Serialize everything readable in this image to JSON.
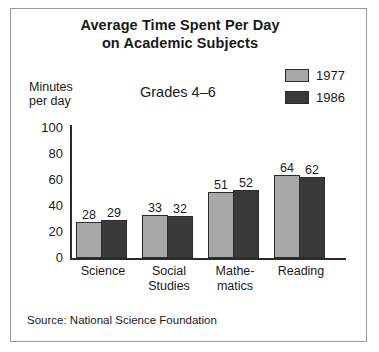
{
  "chart_data": {
    "type": "bar",
    "title": "Average Time Spent Per Day on Academic Subjects",
    "title_lines": [
      "Average Time Spent Per Day",
      "on Academic Subjects"
    ],
    "subtitle": "Grades 4–6",
    "ylabel": "Minutes per day",
    "ylabel_lines": [
      "Minutes",
      "per day"
    ],
    "xlabel": "",
    "categories": [
      "Science",
      "Social Studies",
      "Mathematics",
      "Reading"
    ],
    "category_lines": [
      [
        "Science"
      ],
      [
        "Social",
        "Studies"
      ],
      [
        "Mathe-",
        "matics"
      ],
      [
        "Reading"
      ]
    ],
    "series": [
      {
        "name": "1977",
        "color": "#a8a8a8",
        "values": [
          28,
          33,
          51,
          64
        ]
      },
      {
        "name": "1986",
        "color": "#3a3a3a",
        "values": [
          29,
          32,
          52,
          62
        ]
      }
    ],
    "ylim": [
      0,
      100
    ],
    "yticks": [
      100,
      80,
      60,
      40,
      20,
      0
    ],
    "grid": false,
    "legend_position": "top-right",
    "source": "Source: National Science Foundation"
  },
  "legend": {
    "items": [
      {
        "label": "1977",
        "color": "#a8a8a8"
      },
      {
        "label": "1986",
        "color": "#3a3a3a"
      }
    ]
  },
  "colors": {
    "series_1977": "#a8a8a8",
    "series_1986": "#3a3a3a",
    "axis": "#2b2b2b",
    "frame": "#9a9a9a",
    "background": "#ffffff",
    "text": "#1a1a1a"
  }
}
